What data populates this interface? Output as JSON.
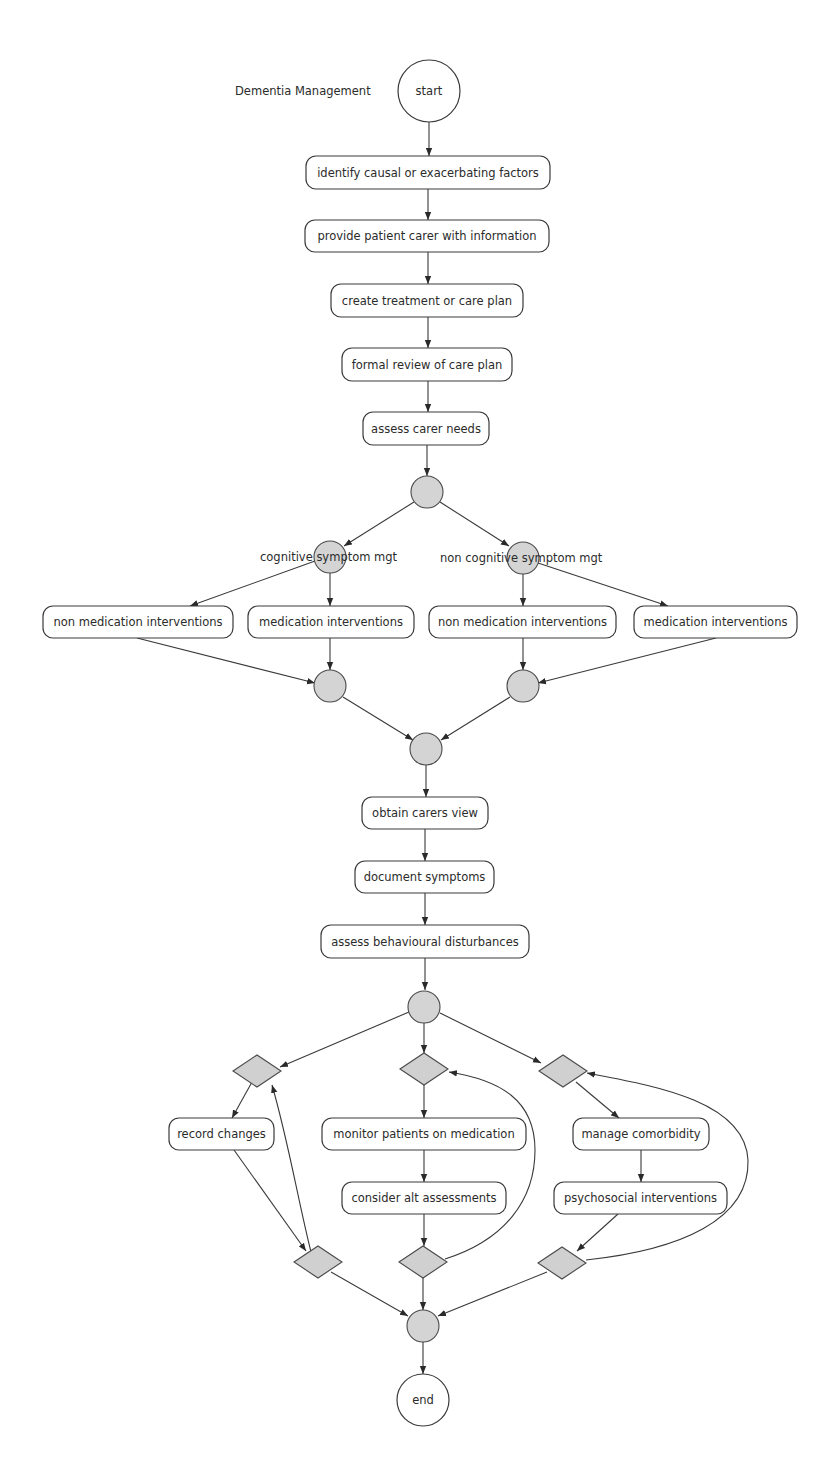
{
  "title": "Dementia Management",
  "terminals": {
    "start": "start",
    "end": "end"
  },
  "main_sequence": [
    "identify causal or exacerbating factors",
    "provide patient carer with information",
    "create treatment or care plan",
    "formal review of care plan",
    "assess carer needs"
  ],
  "branches": {
    "cognitive": {
      "label": "cognitive symptom mgt",
      "activities": [
        "non medication interventions",
        "medication interventions"
      ]
    },
    "non_cognitive": {
      "label": "non cognitive symptom mgt",
      "activities": [
        "non medication interventions",
        "medication interventions"
      ]
    }
  },
  "post_merge_sequence": [
    "obtain carers view",
    "document symptoms",
    "assess behavioural disturbances"
  ],
  "loops": {
    "left": [
      "record changes"
    ],
    "middle": [
      "monitor patients on medication",
      "consider alt assessments"
    ],
    "right": [
      "manage comorbidity",
      "psychosocial interventions"
    ]
  },
  "colors": {
    "gateway_fill": "#d4d4d4",
    "decision_fill": "#d0d0d0",
    "stroke": "#3a3a3a",
    "box_fill": "#ffffff"
  }
}
